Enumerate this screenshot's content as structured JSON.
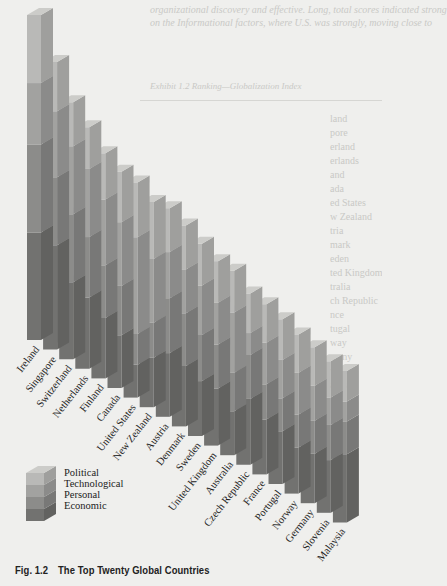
{
  "page": {
    "bleed_top_lines": [
      "organizational discovery and effective. Long, total scores indicated strong",
      "on the Informational factors, where U.S. was strongly, moving close to"
    ],
    "bleed_table_title": "Exhibit 1.2   Ranking—Globalization Index",
    "bleed_column": [
      "land",
      "pore",
      "erland",
      "erlands",
      "and",
      "ada",
      "ed States",
      "w Zealand",
      "tria",
      "mark",
      "eden",
      "ted Kingdom",
      "tralia",
      "ch Republic",
      "nce",
      "tugal",
      "way",
      "many",
      "venia",
      "aysia"
    ]
  },
  "caption": {
    "label": "Fig. 1.2",
    "title": "The Top Twenty Global Countries"
  },
  "legend": {
    "items": [
      {
        "name": "Political",
        "color": "#b9b9b7"
      },
      {
        "name": "Technological",
        "color": "#a2a2a0"
      },
      {
        "name": "Personal",
        "color": "#8c8c8a"
      },
      {
        "name": "Economic",
        "color": "#727270"
      }
    ]
  },
  "chart_data": {
    "type": "bar",
    "subtype": "3d-stacked-column",
    "title": "The Top Twenty Global Countries",
    "xlabel": "",
    "ylabel": "",
    "grid": false,
    "legend_position": "bottom-left",
    "categories": [
      "Ireland",
      "Singapore",
      "Switzerland",
      "Netherlands",
      "Finland",
      "Canada",
      "United States",
      "New Zealand",
      "Austria",
      "Denmark",
      "Sweden",
      "United Kingdom",
      "Australia",
      "Czech Republic",
      "France",
      "Portugal",
      "Norway",
      "Germany",
      "Slovenia",
      "Malaysia"
    ],
    "series": [
      {
        "name": "Economic",
        "values": [
          98,
          95,
          70,
          65,
          55,
          48,
          30,
          45,
          58,
          55,
          50,
          52,
          40,
          60,
          50,
          48,
          42,
          45,
          48,
          62
        ]
      },
      {
        "name": "Personal",
        "values": [
          80,
          62,
          62,
          55,
          48,
          45,
          28,
          32,
          50,
          48,
          42,
          40,
          35,
          40,
          32,
          30,
          30,
          30,
          32,
          30
        ]
      },
      {
        "name": "Technological",
        "values": [
          56,
          60,
          62,
          62,
          60,
          58,
          88,
          58,
          42,
          40,
          45,
          38,
          55,
          20,
          38,
          35,
          38,
          32,
          25,
          18
        ]
      },
      {
        "name": "Political",
        "values": [
          62,
          45,
          40,
          38,
          42,
          46,
          50,
          52,
          40,
          40,
          38,
          38,
          38,
          36,
          35,
          37,
          35,
          35,
          33,
          28
        ]
      }
    ],
    "note": "Values are relative segment heights estimated from the pixel geometry (no numeric axis shown)."
  }
}
